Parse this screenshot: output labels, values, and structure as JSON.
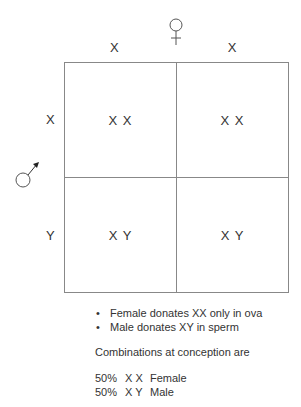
{
  "header": {
    "female_symbol": "female-symbol",
    "columns": [
      "X",
      "X"
    ]
  },
  "side": {
    "male_symbol": "male-symbol",
    "rows": [
      "X",
      "Y"
    ]
  },
  "grid": {
    "cells": [
      [
        "X X",
        "X X"
      ],
      [
        "X Y",
        "X Y"
      ]
    ]
  },
  "notes": {
    "bullets": [
      "Female donates XX only in ova",
      "Male donates XY in sperm"
    ],
    "heading": "Combinations at conception are",
    "results": [
      {
        "pct": "50%",
        "genotype": "X X",
        "sex": "Female"
      },
      {
        "pct": "50%",
        "genotype": "X Y",
        "sex": "Male"
      }
    ]
  }
}
